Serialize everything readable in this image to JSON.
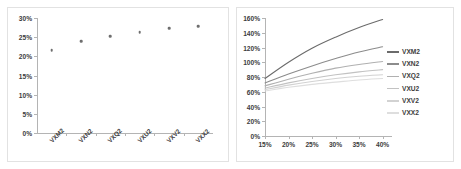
{
  "chart_data": [
    {
      "id": "left",
      "type": "scatter",
      "title": "",
      "xlabel": "",
      "ylabel": "",
      "grid": false,
      "legend": "none",
      "categories": [
        "VXM2",
        "VXN2",
        "VXQ2",
        "VXU2",
        "VXV2",
        "VXX2"
      ],
      "values": [
        0.216,
        0.239,
        0.252,
        0.263,
        0.273,
        0.279
      ],
      "ylim": [
        0,
        0.3
      ],
      "ytick_labels": [
        "30%",
        "25%",
        "20%",
        "15%",
        "10%",
        "5%",
        "0%"
      ],
      "ytick_values": [
        0.3,
        0.25,
        0.2,
        0.15,
        0.1,
        0.05,
        0.0
      ],
      "marker_color": "#6e6e6e"
    },
    {
      "id": "right",
      "type": "line",
      "title": "",
      "xlabel": "",
      "ylabel": "",
      "grid": false,
      "legend": "right",
      "x": [
        0.15,
        0.2,
        0.25,
        0.3,
        0.35,
        0.4
      ],
      "xtick_labels": [
        "15%",
        "20%",
        "25%",
        "30%",
        "35%",
        "40%"
      ],
      "xlim": [
        0.15,
        0.42
      ],
      "ylim": [
        0.0,
        1.6
      ],
      "ytick_labels": [
        "160%",
        "140%",
        "120%",
        "100%",
        "80%",
        "60%",
        "40%",
        "20%",
        "0%"
      ],
      "ytick_values": [
        1.6,
        1.4,
        1.2,
        1.0,
        0.8,
        0.6,
        0.4,
        0.2,
        0.0
      ],
      "series": [
        {
          "name": "VXM2",
          "color": "#6b6b6b",
          "values": [
            0.78,
            1.0,
            1.19,
            1.34,
            1.47,
            1.58
          ]
        },
        {
          "name": "VXN2",
          "color": "#8c8c8c",
          "values": [
            0.72,
            0.84,
            0.95,
            1.05,
            1.14,
            1.21
          ]
        },
        {
          "name": "VXQ2",
          "color": "#b0b0b0",
          "values": [
            0.68,
            0.77,
            0.85,
            0.92,
            0.97,
            1.01
          ]
        },
        {
          "name": "VXU2",
          "color": "#c2c2c2",
          "values": [
            0.65,
            0.72,
            0.78,
            0.83,
            0.87,
            0.9
          ]
        },
        {
          "name": "VXV2",
          "color": "#d2d2d2",
          "values": [
            0.63,
            0.69,
            0.74,
            0.78,
            0.81,
            0.83
          ]
        },
        {
          "name": "VXX2",
          "color": "#dedede",
          "values": [
            0.61,
            0.66,
            0.7,
            0.73,
            0.76,
            0.78
          ]
        }
      ]
    }
  ]
}
